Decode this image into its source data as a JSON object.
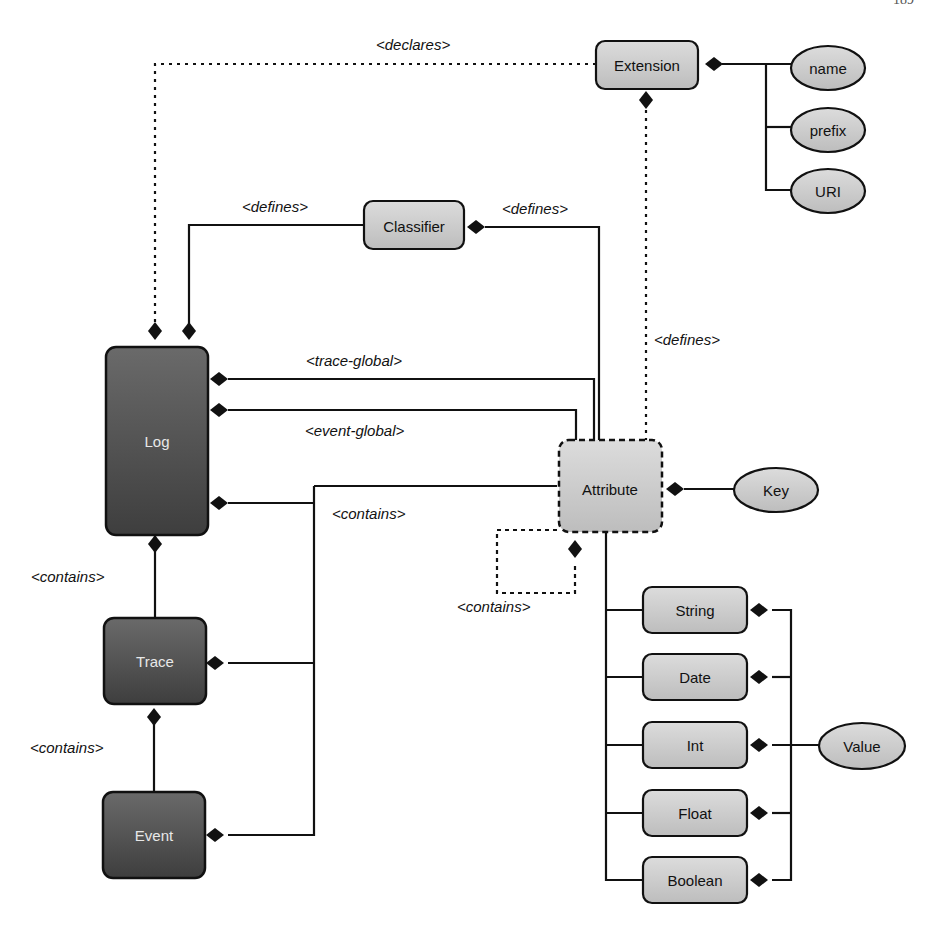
{
  "page": {
    "number": "189"
  },
  "diagram": {
    "nodes": {
      "log": "Log",
      "trace": "Trace",
      "event": "Event",
      "extension": "Extension",
      "classifier": "Classifier",
      "attribute": "Attribute",
      "key": "Key",
      "value": "Value",
      "name": "name",
      "prefix": "prefix",
      "uri": "URI",
      "types": [
        "String",
        "Date",
        "Int",
        "Float",
        "Boolean"
      ]
    },
    "labels": {
      "declares": "<declares>",
      "defines_log_classifier": "<defines>",
      "defines_classifier_attribute": "<defines>",
      "defines_extension_attribute": "<defines>",
      "trace_global": "<trace-global>",
      "event_global": "<event-global>",
      "contains_attr": "<contains>",
      "contains_self": "<contains>",
      "contains_log_trace": "<contains>",
      "contains_trace_event": "<contains>"
    },
    "colors": {
      "dark_node": "#5a5a5a",
      "light_node": "#cfcfcf",
      "line": "#111111"
    }
  }
}
